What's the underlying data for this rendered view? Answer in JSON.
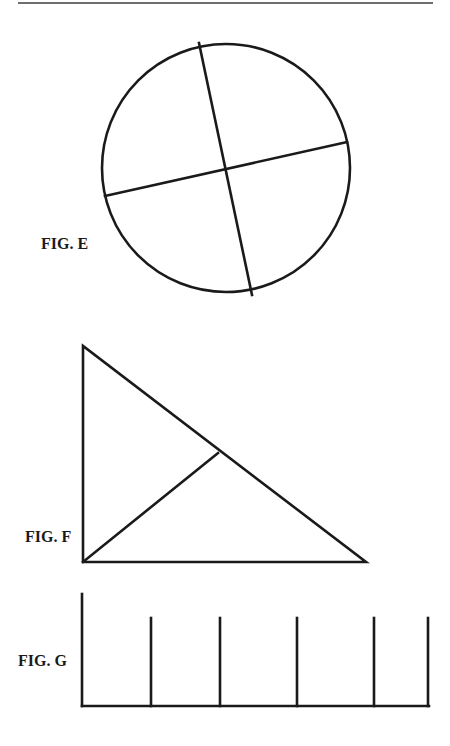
{
  "page": {
    "header_rule": {
      "x1": 18,
      "y1": 3,
      "x2": 433,
      "y2": 3,
      "color": "#6e6e6e",
      "width": 2
    }
  },
  "style": {
    "stroke_color": "#1a1a1a",
    "stroke_width": 2.6,
    "label_color": "#1a1a1a"
  },
  "figures": [
    {
      "id": "E",
      "label": "FIG. E",
      "label_pos": {
        "x": 41,
        "y": 236
      },
      "shape": "circle divided into four quadrants",
      "circle": {
        "cx": 226,
        "cy": 168,
        "r": 124
      },
      "lines": [
        {
          "x1": 199,
          "y1": 43,
          "x2": 252,
          "y2": 295
        },
        {
          "x1": 105,
          "y1": 196,
          "x2": 347,
          "y2": 142
        }
      ]
    },
    {
      "id": "F",
      "label": "FIG. F",
      "label_pos": {
        "x": 25,
        "y": 529
      },
      "shape": "right triangle divided by a line from the right-angle vertex to the hypotenuse",
      "polygon": [
        [
          83,
          346
        ],
        [
          83,
          562
        ],
        [
          366,
          562
        ]
      ],
      "lines": [
        {
          "x1": 83,
          "y1": 562,
          "x2": 218,
          "y2": 453
        }
      ]
    },
    {
      "id": "G",
      "label": "FIG. G",
      "label_pos": {
        "x": 18,
        "y": 653
      },
      "shape": "baseline with one tall left post and five shorter vertical posts",
      "baseline": {
        "x1": 82,
        "y1": 706,
        "x2": 429,
        "y2": 706
      },
      "tall_post": {
        "x": 82,
        "y_top": 594,
        "y_bottom": 706
      },
      "short_posts": [
        {
          "x": 151,
          "y_top": 618,
          "y_bottom": 706
        },
        {
          "x": 220,
          "y_top": 618,
          "y_bottom": 706
        },
        {
          "x": 297,
          "y_top": 618,
          "y_bottom": 706
        },
        {
          "x": 374,
          "y_top": 618,
          "y_bottom": 706
        },
        {
          "x": 428,
          "y_top": 618,
          "y_bottom": 706
        }
      ]
    }
  ]
}
